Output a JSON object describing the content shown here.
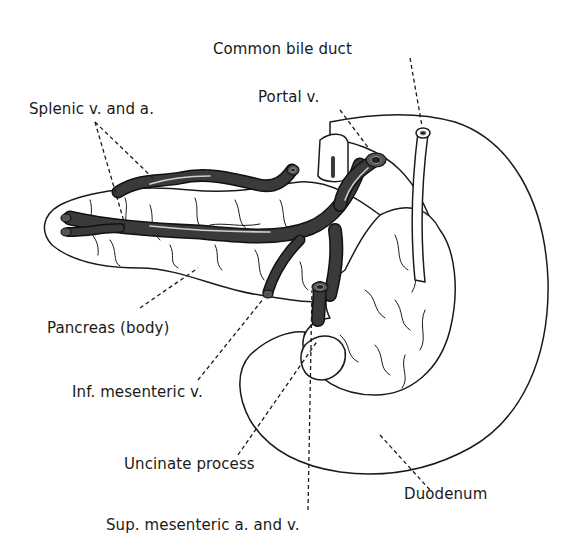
{
  "diagram": {
    "labels": {
      "common_bile_duct": "Common bile duct",
      "portal_vein": "Portal v.",
      "splenic": "Splenic v. and a.",
      "pancreas_body": "Pancreas (body)",
      "inf_mesenteric": "Inf. mesenteric v.",
      "uncinate": "Uncinate process",
      "duodenum": "Duodenum",
      "sup_mesenteric": "Sup. mesenteric a. and v."
    },
    "colors": {
      "vessel": "#3a3a3a",
      "outline": "#1a1a1a",
      "background": "#ffffff"
    }
  }
}
